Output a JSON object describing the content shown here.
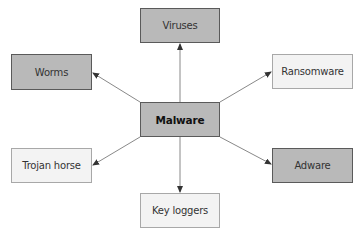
{
  "diagram": {
    "center": {
      "id": "malware",
      "label": "Malware",
      "style": "dark",
      "x": 140,
      "y": 102,
      "w": 80,
      "h": 35
    },
    "nodes": [
      {
        "id": "viruses",
        "label": "Viruses",
        "style": "dark",
        "x": 140,
        "y": 8,
        "w": 80,
        "h": 35
      },
      {
        "id": "worms",
        "label": "Worms",
        "style": "dark",
        "x": 11,
        "y": 54,
        "w": 81,
        "h": 36
      },
      {
        "id": "ransomware",
        "label": "Ransomware",
        "style": "light",
        "x": 272,
        "y": 54,
        "w": 81,
        "h": 35
      },
      {
        "id": "trojan-horse",
        "label": "Trojan horse",
        "style": "light",
        "x": 11,
        "y": 148,
        "w": 81,
        "h": 35
      },
      {
        "id": "adware",
        "label": "Adware",
        "style": "dark",
        "x": 272,
        "y": 148,
        "w": 81,
        "h": 35
      },
      {
        "id": "key-loggers",
        "label": "Key loggers",
        "style": "light",
        "x": 140,
        "y": 193,
        "w": 80,
        "h": 35
      }
    ],
    "edges": [
      {
        "from": "malware",
        "to": "viruses",
        "x1": 180,
        "y1": 102,
        "x2": 180,
        "y2": 44
      },
      {
        "from": "malware",
        "to": "worms",
        "x1": 140,
        "y1": 102,
        "x2": 93,
        "y2": 73
      },
      {
        "from": "malware",
        "to": "ransomware",
        "x1": 220,
        "y1": 102,
        "x2": 271,
        "y2": 72
      },
      {
        "from": "malware",
        "to": "trojan-horse",
        "x1": 140,
        "y1": 137,
        "x2": 93,
        "y2": 165
      },
      {
        "from": "malware",
        "to": "adware",
        "x1": 220,
        "y1": 137,
        "x2": 271,
        "y2": 164
      },
      {
        "from": "malware",
        "to": "key-loggers",
        "x1": 180,
        "y1": 137,
        "x2": 180,
        "y2": 192
      }
    ],
    "colors": {
      "dark_fill": "#b9b9b9",
      "dark_border": "#5a5a5a",
      "light_fill": "#f3f3f3",
      "light_border": "#a8a8a8",
      "edge": "#7a7a7a",
      "arrowhead": "#333333"
    }
  }
}
